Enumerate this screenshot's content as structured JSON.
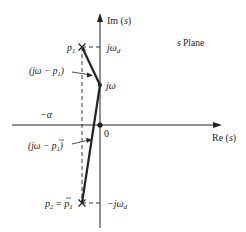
{
  "diagram": {
    "plane_label": "s Plane",
    "axes": {
      "imaginary_label": "Im (s)",
      "real_label": "Re (s)",
      "origin_label": "0"
    },
    "points": {
      "p1_label": "p",
      "p1_sub": "1",
      "p2_label": "p",
      "p2_sub": "2",
      "p2_eq": " = ",
      "p2_conj": "p",
      "p2_conj_sub": "1",
      "jw_label": "jω",
      "jwd_label": "jω",
      "jwd_sub": "d",
      "neg_jwd_label": "−jω",
      "neg_jwd_sub": "d",
      "alpha_label": "−α"
    },
    "vectors": {
      "upper_label_open": "(jω − p",
      "upper_label_sub": "1",
      "upper_label_close": ")",
      "lower_label_open": "(jω − ",
      "lower_label_p": "p",
      "lower_label_sub": "1",
      "lower_label_close": ")"
    },
    "colors": {
      "ink": "#222222",
      "background": "#ffffff"
    }
  }
}
